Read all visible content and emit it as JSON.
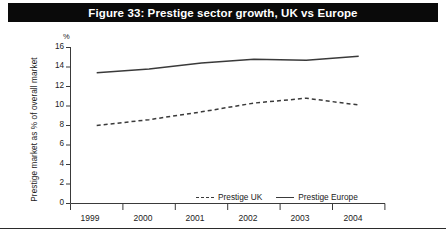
{
  "figure": {
    "title": "Figure 33: Prestige sector growth, UK vs Europe",
    "title_bar_color": "#0a0a0a",
    "title_text_color": "#ffffff",
    "background_color": "#ffffff"
  },
  "axes": {
    "unit_symbol": "%",
    "y_axis_title": "Prestige market as % of overall market",
    "y_ticks": [
      "16",
      "14",
      "12",
      "10",
      "8",
      "6",
      "4",
      "2",
      "0"
    ],
    "x_ticks": [
      "1999",
      "2000",
      "2001",
      "2002",
      "2003",
      "2004"
    ]
  },
  "legend": {
    "position": "inside-bottom-center",
    "entries": [
      {
        "label": "Prestige UK",
        "style": "dashed",
        "color": "#3a3a3a"
      },
      {
        "label": "Prestige Europe",
        "style": "solid",
        "color": "#3a3a3a"
      }
    ]
  },
  "chart_data": {
    "type": "line",
    "title": "Figure 33: Prestige sector growth, UK vs Europe",
    "xlabel": "",
    "ylabel": "Prestige market as % of overall market",
    "categories": [
      "1999",
      "2000",
      "2001",
      "2002",
      "2003",
      "2004"
    ],
    "ylim": [
      0,
      16
    ],
    "ytick_step": 2,
    "grid": false,
    "unit": "%",
    "series": [
      {
        "name": "Prestige UK",
        "style": "dashed",
        "color": "#3a3a3a",
        "values": [
          8.0,
          8.6,
          9.4,
          10.3,
          10.8,
          10.1
        ]
      },
      {
        "name": "Prestige Europe",
        "style": "solid",
        "color": "#3a3a3a",
        "values": [
          13.4,
          13.8,
          14.4,
          14.8,
          14.7,
          15.1
        ]
      }
    ]
  }
}
